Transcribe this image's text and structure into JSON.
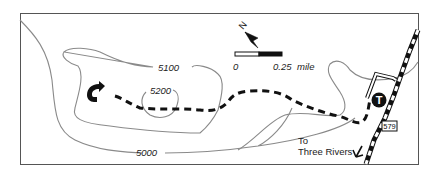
{
  "map": {
    "contour_labels": [
      {
        "text": "5000",
        "x": 147,
        "y": 158
      },
      {
        "text": "5100",
        "x": 172,
        "y": 72
      },
      {
        "text": "5200",
        "x": 166,
        "y": 95
      }
    ],
    "scale_bar": {
      "start_label": "0",
      "end_label": "0.25",
      "unit_label": "mile"
    },
    "north_arrow": {
      "label": "N"
    },
    "route_shield": {
      "text": "579"
    },
    "destination": {
      "line1": "To",
      "line2": "Three Rivers"
    },
    "trailhead": {
      "symbol": "T"
    },
    "colors": {
      "contour": "#8a8a8a",
      "trail": "#111111",
      "frame": "#555555",
      "road": "#111111"
    }
  }
}
